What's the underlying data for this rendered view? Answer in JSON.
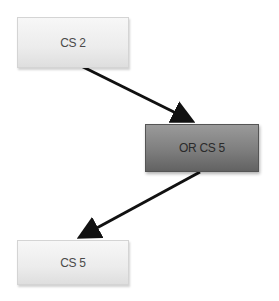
{
  "diagram": {
    "nodes": [
      {
        "id": "cs2",
        "label": "CS 2",
        "style": "light"
      },
      {
        "id": "orcs5",
        "label": "OR CS 5",
        "style": "dark"
      },
      {
        "id": "cs5",
        "label": "CS 5",
        "style": "light"
      }
    ],
    "edges": [
      {
        "from": "cs2",
        "to": "orcs5"
      },
      {
        "from": "orcs5",
        "to": "cs5"
      }
    ],
    "colors": {
      "light_fill": "#ececec",
      "dark_fill": "#7e7e7e",
      "arrow": "#111111"
    }
  }
}
